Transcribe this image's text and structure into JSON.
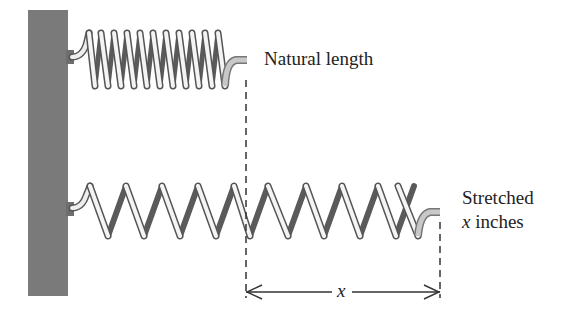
{
  "labels": {
    "natural": "Natural length",
    "stretched_line1": "Stretched",
    "stretched_var": "x",
    "stretched_rest": " inches",
    "dimension": "x"
  },
  "colors": {
    "wall": "#7a7a7a",
    "coil_light": "#f2f2f2",
    "coil_outline": "#555555",
    "coil_back": "#5a5a5a",
    "dash": "#333333",
    "text": "#222222"
  },
  "geometry": {
    "wall": {
      "x": 28,
      "y": 10,
      "w": 40,
      "h": 286
    },
    "top_spring": {
      "x_start": 88,
      "x_end": 230,
      "y_top": 31,
      "y_bottom": 88,
      "coils": 11,
      "attach_y": 57,
      "tail_end_x": 247,
      "tail_y": 60
    },
    "bottom_spring": {
      "x_start": 90,
      "x_end": 420,
      "y_top": 184,
      "y_bottom": 237,
      "coils": 10,
      "attach_y": 208,
      "tail_end_x": 440,
      "tail_y": 212
    },
    "dash_left_x": 246,
    "dash_right_x": 440,
    "dimension_y": 292
  }
}
